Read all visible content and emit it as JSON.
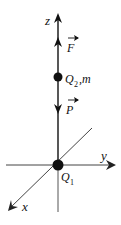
{
  "diagram": {
    "type": "physics-coordinate-system",
    "axes": {
      "z": {
        "label": "z"
      },
      "y": {
        "label": "y"
      },
      "x": {
        "label": "x"
      }
    },
    "charges": [
      {
        "id": "Q1",
        "label": "Q",
        "subscript": "1",
        "position": "origin"
      },
      {
        "id": "Q2",
        "label": "Q",
        "subscript": "2",
        "suffix": ",m",
        "position": "on z-axis above origin"
      }
    ],
    "forces": [
      {
        "id": "F",
        "label": "F",
        "vector": true,
        "direction": "up (+z)"
      },
      {
        "id": "P",
        "label": "P",
        "vector": true,
        "direction": "down (−z)"
      }
    ],
    "colors": {
      "ink": "#111111",
      "axis_gray": "#555555",
      "background": "#ffffff"
    }
  }
}
